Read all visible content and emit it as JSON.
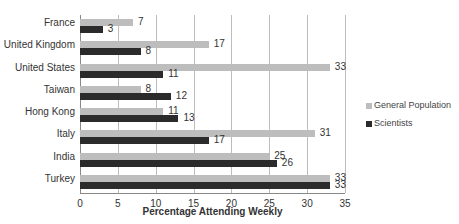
{
  "chart_data": {
    "type": "bar",
    "orientation": "horizontal",
    "title": "",
    "xlabel": "Percentage Attending Weekly",
    "ylabel": "",
    "xlim": [
      0,
      35
    ],
    "x_ticks": [
      "0",
      "5",
      "10",
      "15",
      "20",
      "25",
      "30",
      "35"
    ],
    "grid": true,
    "legend_position": "right",
    "categories": [
      "France",
      "United Kingdom",
      "United States",
      "Taiwan",
      "Hong Kong",
      "Italy",
      "India",
      "Turkey"
    ],
    "series": [
      {
        "name": "General Population",
        "color": "#bdbdbd",
        "values": [
          7,
          17,
          33,
          8,
          11,
          31,
          25,
          33
        ]
      },
      {
        "name": "Scientists",
        "color": "#2b2b2b",
        "values": [
          3,
          8,
          11,
          12,
          13,
          17,
          26,
          33
        ]
      }
    ]
  },
  "legend": {
    "items": [
      {
        "label": "General Population",
        "color": "#bdbdbd"
      },
      {
        "label": "Scientists",
        "color": "#2b2b2b"
      }
    ]
  }
}
